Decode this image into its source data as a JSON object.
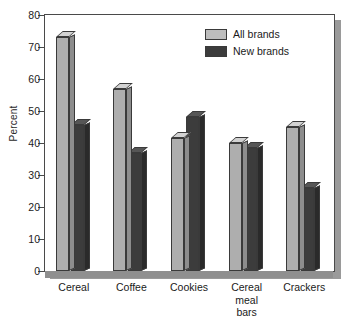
{
  "chart_data": {
    "type": "bar",
    "title": "",
    "xlabel": "",
    "ylabel": "Percent",
    "ylim": [
      0,
      80
    ],
    "yticks": [
      0,
      10,
      20,
      30,
      40,
      50,
      60,
      70,
      80
    ],
    "grid": false,
    "legend_position": "top-right",
    "categories": [
      "Cereal",
      "Coffee",
      "Cookies",
      "Cereal\nmeal\nbars",
      "Crackers"
    ],
    "series": [
      {
        "name": "All brands",
        "color": "#aeaeae",
        "values": [
          73,
          57,
          41.5,
          40,
          45
        ]
      },
      {
        "name": "New brands",
        "color": "#3c3c3c",
        "values": [
          45.5,
          37,
          48,
          38.5,
          26
        ]
      }
    ]
  },
  "legend": {
    "items": [
      {
        "label": "All brands"
      },
      {
        "label": "New brands"
      }
    ]
  },
  "axis": {
    "y_title": "Percent",
    "y_ticks": [
      "0",
      "10",
      "20",
      "30",
      "40",
      "50",
      "60",
      "70",
      "80"
    ]
  },
  "x_categories": [
    {
      "label": "Cereal"
    },
    {
      "label": "Coffee"
    },
    {
      "label": "Cookies"
    },
    {
      "label": "Cereal\nmeal\nbars"
    },
    {
      "label": "Crackers"
    }
  ]
}
